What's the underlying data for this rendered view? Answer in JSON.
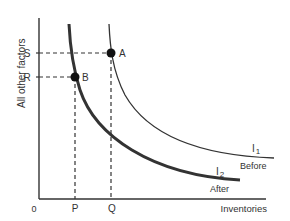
{
  "diagram": {
    "y_axis_label": "All other factors",
    "x_axis_label": "Inventories",
    "origin_label": "0",
    "y_ticks": [
      {
        "label": "S"
      },
      {
        "label": "R"
      }
    ],
    "x_ticks": [
      {
        "label": "P"
      },
      {
        "label": "Q"
      }
    ],
    "points": [
      {
        "label": "A"
      },
      {
        "label": "B"
      }
    ],
    "curves": [
      {
        "name": "I",
        "subscript": "1",
        "caption": "Before"
      },
      {
        "name": "I",
        "subscript": "2",
        "caption": "After"
      }
    ]
  }
}
